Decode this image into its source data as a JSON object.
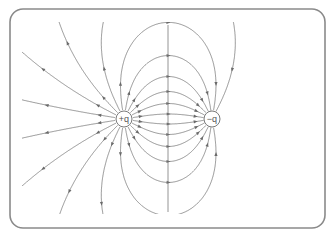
{
  "diagram": {
    "frame": {
      "x": 10,
      "y": 9,
      "width": 315,
      "height": 219,
      "radius": 13,
      "stroke": "#8a8a8a"
    },
    "clip": {
      "x": 22,
      "y": 22,
      "width": 290,
      "height": 192
    },
    "line_color": "#7a7a7a",
    "charges": [
      {
        "id": "positive",
        "label": "+q",
        "x": 124,
        "y": 119,
        "r": 8,
        "sign": 1
      },
      {
        "id": "negative",
        "label": "−q",
        "x": 212,
        "y": 119,
        "r": 8,
        "sign": -1
      }
    ],
    "field_line_count": 20,
    "axis_line": {
      "x": 168,
      "y1": 25,
      "y2": 212
    }
  }
}
